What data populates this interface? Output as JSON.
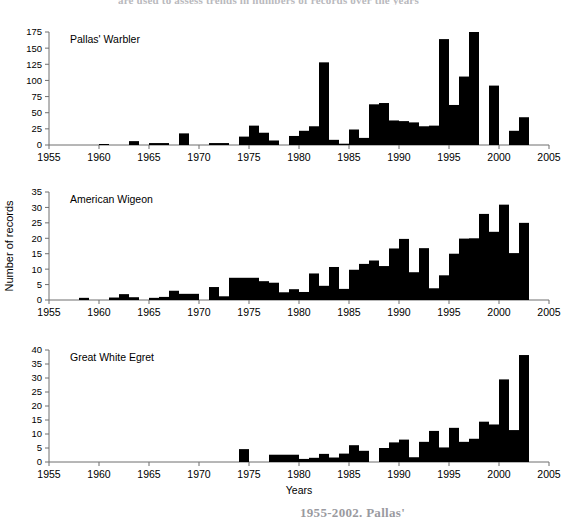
{
  "figure": {
    "caption_top": "are used to assess trends in numbers of records over the years",
    "caption_bottom": "1955-2002. Pallas'",
    "background": "#ffffff",
    "bar_color": "#000000",
    "axis_color": "#6f6f6f"
  },
  "axis": {
    "x_label": "Years",
    "y_label": "Number of records",
    "x_ticks": [
      1955,
      1960,
      1965,
      1970,
      1975,
      1980,
      1985,
      1990,
      1995,
      2000,
      2005
    ],
    "x_min": 1955,
    "x_max": 2005
  },
  "chart_data": [
    {
      "type": "bar",
      "title": "Pallas' Warbler",
      "xlabel": "",
      "ylabel": "",
      "xlim": [
        1955,
        2005
      ],
      "ylim": [
        0,
        175
      ],
      "yticks": [
        0,
        25,
        50,
        75,
        100,
        125,
        150,
        175
      ],
      "xticks": [
        1955,
        1960,
        1965,
        1970,
        1975,
        1980,
        1985,
        1990,
        1995,
        2000,
        2005
      ],
      "grid": false,
      "legend": "none",
      "x": [
        1955,
        1956,
        1957,
        1958,
        1959,
        1960,
        1961,
        1962,
        1963,
        1964,
        1965,
        1966,
        1967,
        1968,
        1969,
        1970,
        1971,
        1972,
        1973,
        1974,
        1975,
        1976,
        1977,
        1978,
        1979,
        1980,
        1981,
        1982,
        1983,
        1984,
        1985,
        1986,
        1987,
        1988,
        1989,
        1990,
        1991,
        1992,
        1993,
        1994,
        1995,
        1996,
        1997,
        1998,
        1999,
        2000,
        2001,
        2002
      ],
      "values": [
        0,
        0,
        0,
        0,
        0,
        1,
        0,
        0,
        6,
        0,
        3,
        3,
        0,
        18,
        0,
        0,
        3,
        3,
        0,
        13,
        30,
        19,
        7,
        0,
        14,
        22,
        29,
        128,
        8,
        2,
        24,
        11,
        63,
        65,
        38,
        37,
        35,
        29,
        30,
        164,
        62,
        106,
        175,
        0,
        92,
        0,
        22,
        43
      ]
    },
    {
      "type": "bar",
      "title": "American Wigeon",
      "xlabel": "",
      "ylabel": "Number of records",
      "xlim": [
        1955,
        2005
      ],
      "ylim": [
        0,
        35
      ],
      "yticks": [
        0,
        5,
        10,
        15,
        20,
        25,
        30,
        35
      ],
      "xticks": [
        1955,
        1960,
        1965,
        1970,
        1975,
        1980,
        1985,
        1990,
        1995,
        2000,
        2005
      ],
      "grid": false,
      "legend": "none",
      "x": [
        1955,
        1956,
        1957,
        1958,
        1959,
        1960,
        1961,
        1962,
        1963,
        1964,
        1965,
        1966,
        1967,
        1968,
        1969,
        1970,
        1971,
        1972,
        1973,
        1974,
        1975,
        1976,
        1977,
        1978,
        1979,
        1980,
        1981,
        1982,
        1983,
        1984,
        1985,
        1986,
        1987,
        1988,
        1989,
        1990,
        1991,
        1992,
        1993,
        1994,
        1995,
        1996,
        1997,
        1998,
        1999,
        2000,
        2001,
        2002
      ],
      "values": [
        0,
        0,
        0,
        0.7,
        0,
        0,
        0.8,
        1.9,
        0.9,
        0,
        0.7,
        1,
        3,
        2,
        2,
        0,
        4.2,
        1.2,
        7.2,
        7.2,
        7.2,
        6.1,
        5.6,
        2.5,
        3.5,
        2.6,
        8.6,
        4.6,
        10.7,
        3.6,
        9.8,
        11.7,
        12.8,
        11,
        16.7,
        19.8,
        9,
        16.8,
        3.8,
        8,
        15,
        19.9,
        20,
        27.9,
        22.1,
        30.9,
        15.2,
        25
      ]
    },
    {
      "type": "bar",
      "title": "Great White Egret",
      "xlabel": "Years",
      "ylabel": "",
      "xlim": [
        1955,
        2005
      ],
      "ylim": [
        0,
        40
      ],
      "yticks": [
        0,
        5,
        10,
        15,
        20,
        25,
        30,
        35,
        40
      ],
      "xticks": [
        1955,
        1960,
        1965,
        1970,
        1975,
        1980,
        1985,
        1990,
        1995,
        2000,
        2005
      ],
      "grid": false,
      "legend": "none",
      "x": [
        1955,
        1956,
        1957,
        1958,
        1959,
        1960,
        1961,
        1962,
        1963,
        1964,
        1965,
        1966,
        1967,
        1968,
        1969,
        1970,
        1971,
        1972,
        1973,
        1974,
        1975,
        1976,
        1977,
        1978,
        1979,
        1980,
        1981,
        1982,
        1983,
        1984,
        1985,
        1986,
        1987,
        1988,
        1989,
        1990,
        1991,
        1992,
        1993,
        1994,
        1995,
        1996,
        1997,
        1998,
        1999,
        2000,
        2001,
        2002
      ],
      "values": [
        0,
        0,
        0,
        0,
        0,
        0,
        0,
        0,
        0,
        0,
        0,
        0,
        0,
        0,
        0,
        0,
        0,
        0,
        0,
        4.6,
        0,
        0,
        2.6,
        2.6,
        2.6,
        1.1,
        1.5,
        2.9,
        1.6,
        3,
        6,
        4,
        0,
        5,
        7,
        8,
        1.7,
        7.2,
        11.1,
        5.2,
        12.2,
        7.2,
        8.3,
        14.4,
        13.4,
        29.5,
        11.4,
        38.2
      ]
    }
  ]
}
